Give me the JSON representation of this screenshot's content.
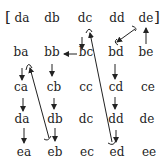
{
  "diagram": {
    "open_bracket": "[",
    "close_bracket": "]",
    "grid": [
      [
        "da",
        "db",
        "dc",
        "dd",
        "de"
      ],
      [
        "ba",
        "bb",
        "bc",
        "bd",
        "be"
      ],
      [
        "ca",
        "cb",
        "cc",
        "cd",
        "ce"
      ],
      [
        "da",
        "db",
        "dc",
        "dd",
        "de"
      ],
      [
        "ea",
        "eb",
        "ec",
        "ed",
        "ee"
      ]
    ],
    "arrows": [
      {
        "from": "bc",
        "to": "bb",
        "type": "straight"
      },
      {
        "from": "dc",
        "to": "bc",
        "type": "straight"
      },
      {
        "from": "be",
        "to": "de",
        "type": "straight"
      },
      {
        "from": "de",
        "to": "bd",
        "type": "straight"
      },
      {
        "from": "bb",
        "to": "cb",
        "type": "straight"
      },
      {
        "from": "bd",
        "to": "cd",
        "type": "straight"
      },
      {
        "from": "ba",
        "to": "ca",
        "type": "straight"
      },
      {
        "from": "ca",
        "to": "da",
        "type": "straight"
      },
      {
        "from": "da",
        "to": "ea",
        "type": "straight"
      },
      {
        "from": "cb",
        "to": "db",
        "type": "straight"
      },
      {
        "from": "db",
        "to": "eb",
        "type": "straight"
      },
      {
        "from": "cd",
        "to": "dd",
        "type": "straight"
      },
      {
        "from": "dd",
        "to": "ed",
        "type": "straight"
      },
      {
        "from": "eb",
        "to": "ba",
        "type": "long-curve"
      },
      {
        "from": "ed",
        "to": "dc",
        "type": "long-curve"
      }
    ],
    "colors": {
      "ink": "#222222",
      "background": "#ffffff"
    }
  }
}
